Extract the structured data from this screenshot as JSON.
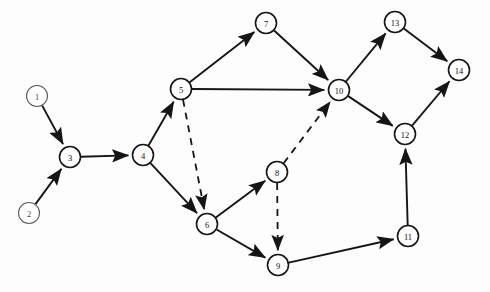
{
  "figure": {
    "kind": "directed-graph",
    "background_color": "#fdfdfd",
    "stroke_color": "#151515",
    "node_fill_color": "#ffffff",
    "node_radius": 10.5,
    "solid_edge_style": "solid",
    "dashed_edge_style": "dashed"
  },
  "nodes": [
    {
      "id": "1",
      "label": "1",
      "x": 37,
      "y": 96,
      "style": "faint"
    },
    {
      "id": "2",
      "label": "2",
      "x": 29,
      "y": 213,
      "style": "faint"
    },
    {
      "id": "3",
      "label": "3",
      "x": 70,
      "y": 157,
      "style": "normal"
    },
    {
      "id": "4",
      "label": "4",
      "x": 143,
      "y": 155,
      "style": "normal"
    },
    {
      "id": "5",
      "label": "5",
      "x": 181,
      "y": 89,
      "style": "normal"
    },
    {
      "id": "6",
      "label": "6",
      "x": 207,
      "y": 224,
      "style": "normal"
    },
    {
      "id": "7",
      "label": "7",
      "x": 266,
      "y": 23,
      "style": "normal"
    },
    {
      "id": "8",
      "label": "8",
      "x": 277,
      "y": 172,
      "style": "normal"
    },
    {
      "id": "9",
      "label": "9",
      "x": 278,
      "y": 265,
      "style": "normal"
    },
    {
      "id": "10",
      "label": "10",
      "x": 339,
      "y": 90,
      "style": "normal"
    },
    {
      "id": "11",
      "label": "11",
      "x": 408,
      "y": 236,
      "style": "normal"
    },
    {
      "id": "12",
      "label": "12",
      "x": 405,
      "y": 134,
      "style": "normal"
    },
    {
      "id": "13",
      "label": "13",
      "x": 395,
      "y": 22,
      "style": "normal"
    },
    {
      "id": "14",
      "label": "14",
      "x": 459,
      "y": 70,
      "style": "normal"
    }
  ],
  "edges": [
    {
      "from": "1",
      "to": "3",
      "style": "solid",
      "directed": true
    },
    {
      "from": "2",
      "to": "3",
      "style": "solid",
      "directed": true
    },
    {
      "from": "3",
      "to": "4",
      "style": "solid",
      "directed": true
    },
    {
      "from": "4",
      "to": "5",
      "style": "solid",
      "directed": true
    },
    {
      "from": "4",
      "to": "6",
      "style": "solid",
      "directed": true
    },
    {
      "from": "5",
      "to": "7",
      "style": "solid",
      "directed": true
    },
    {
      "from": "5",
      "to": "10",
      "style": "solid",
      "directed": true
    },
    {
      "from": "5",
      "to": "6",
      "style": "dashed",
      "directed": true
    },
    {
      "from": "7",
      "to": "10",
      "style": "solid",
      "directed": true
    },
    {
      "from": "6",
      "to": "8",
      "style": "solid",
      "directed": true
    },
    {
      "from": "6",
      "to": "9",
      "style": "solid",
      "directed": true
    },
    {
      "from": "8",
      "to": "10",
      "style": "dashed",
      "directed": true
    },
    {
      "from": "8",
      "to": "9",
      "style": "dashed",
      "directed": true
    },
    {
      "from": "9",
      "to": "11",
      "style": "solid",
      "directed": true
    },
    {
      "from": "11",
      "to": "12",
      "style": "solid",
      "directed": true
    },
    {
      "from": "10",
      "to": "13",
      "style": "solid",
      "directed": true
    },
    {
      "from": "10",
      "to": "12",
      "style": "solid",
      "directed": true
    },
    {
      "from": "13",
      "to": "14",
      "style": "solid",
      "directed": true
    },
    {
      "from": "12",
      "to": "14",
      "style": "solid",
      "directed": true
    }
  ]
}
